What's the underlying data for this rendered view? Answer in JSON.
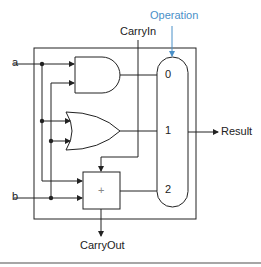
{
  "diagram": {
    "type": "1-bit ALU",
    "labels": {
      "operation": "Operation",
      "carry_in": "CarryIn",
      "carry_out": "CarryOut",
      "input_a": "a",
      "input_b": "b",
      "result": "Result",
      "mux_input_0": "0",
      "mux_input_1": "1",
      "mux_input_2": "2",
      "adder_symbol": "+"
    },
    "components": [
      "AND gate",
      "OR gate",
      "Full adder",
      "3-input multiplexer"
    ],
    "colors": {
      "line": "#222222",
      "operation": "#4a90c8",
      "divider": "#888888"
    }
  }
}
